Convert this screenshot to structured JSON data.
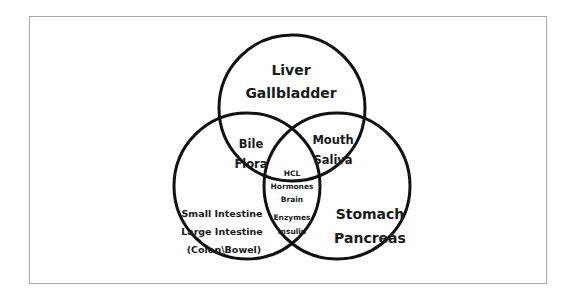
{
  "diagram": {
    "type": "venn-3",
    "circles": [
      {
        "id": "top",
        "cx": 292,
        "cy": 108,
        "r": 74
      },
      {
        "id": "left",
        "cx": 247,
        "cy": 186,
        "r": 73
      },
      {
        "id": "right",
        "cx": 337,
        "cy": 186,
        "r": 74
      }
    ],
    "regions": {
      "top_only": {
        "line1": "Liver",
        "line2": "Gallbladder"
      },
      "right_only": {
        "line1": "Stomach",
        "line2": "Pancreas"
      },
      "left_only": {
        "line1": "Small Intestine",
        "line2": "Large Intestine",
        "line3": "(Colon\\Bowel)"
      },
      "top_left": {
        "line1": "Bile",
        "line2": "Flora"
      },
      "top_right": {
        "line1": "Mouth",
        "line2": "Saliva"
      },
      "all_three": {
        "line1": "HCL",
        "line2": "Hormones",
        "line3": "Brain"
      },
      "left_right": {
        "line1": "Enzymes",
        "line2": "Insulin"
      }
    },
    "colors": {
      "stroke": "#111111",
      "text": "#1a1a1a",
      "frame": "#a8a8a8",
      "background": "#ffffff"
    }
  }
}
